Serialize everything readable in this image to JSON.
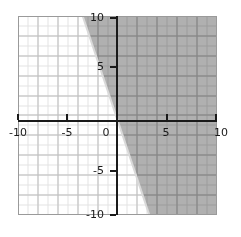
{
  "chart_data": {
    "type": "line",
    "title": "",
    "xlabel": "",
    "ylabel": "",
    "xlim": [
      -10,
      10
    ],
    "ylim": [
      -10,
      10
    ],
    "grid": true,
    "legend": false,
    "x_ticks": [
      -10,
      -5,
      0,
      5,
      10
    ],
    "y_ticks": [
      -10,
      -5,
      0,
      5,
      10
    ],
    "x_tick_labels": [
      "-10",
      "-5",
      "0",
      "5",
      "10"
    ],
    "y_tick_labels": [
      "-10",
      "-5",
      "0",
      "5",
      "10"
    ],
    "minor_grid_step": 0.5,
    "major_grid_step": 1,
    "series": [
      {
        "name": "boundary-line",
        "kind": "linear-boundary",
        "slope": -2.6,
        "intercept": 0.8,
        "line_style": "solid",
        "color": "#d9d9d9",
        "endpoints": [
          [
            -3.5,
            10
          ],
          [
            3.2,
            -10
          ]
        ]
      }
    ],
    "shaded_region": {
      "name": "solution-region",
      "relation": "greater-or-equal",
      "description": "half-plane to the right of and above the boundary line",
      "color": "#808080",
      "polygon_units": [
        [
          -3.5,
          10
        ],
        [
          10,
          10
        ],
        [
          10,
          -10
        ],
        [
          3.2,
          -10
        ]
      ]
    }
  },
  "axes": {
    "x_axis_label": "",
    "y_axis_label": "",
    "origin_label": "0"
  },
  "ticks": {
    "x": [
      {
        "value": -10,
        "label": "-10"
      },
      {
        "value": -5,
        "label": "-5"
      },
      {
        "value": 0,
        "label": "0"
      },
      {
        "value": 5,
        "label": "5"
      },
      {
        "value": 10,
        "label": "10"
      }
    ],
    "y": [
      {
        "value": 10,
        "label": "10"
      },
      {
        "value": 5,
        "label": "5"
      },
      {
        "value": -5,
        "label": "-5"
      },
      {
        "value": -10,
        "label": "-10"
      }
    ]
  },
  "colors": {
    "background": "#ffffff",
    "shade": "#808080",
    "axis": "#1a1a1a",
    "grid_minor": "#e2e2e2",
    "grid_major": "#bdbdbd",
    "boundary": "#d9d9d9"
  }
}
